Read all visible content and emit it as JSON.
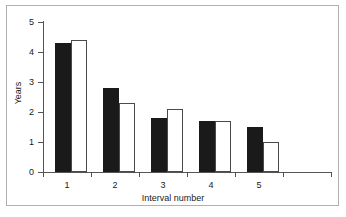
{
  "chart_data": {
    "type": "bar",
    "title": "",
    "subtitle": "",
    "xlabel": "Interval number",
    "ylabel": "Years",
    "categories": [
      "1",
      "2",
      "3",
      "4",
      "5"
    ],
    "series": [
      {
        "name": "series-dark",
        "color": "#1a1a1a",
        "values": [
          4.3,
          2.8,
          1.8,
          1.7,
          1.5
        ]
      },
      {
        "name": "series-light",
        "color": "#ffffff",
        "values": [
          4.4,
          2.3,
          2.1,
          1.7,
          1.0
        ]
      }
    ],
    "ylim": [
      0,
      5
    ],
    "yticks": [
      0,
      1,
      2,
      3,
      4,
      5
    ],
    "ytick_labels": [
      "0",
      "1",
      "2",
      "3",
      "4",
      "5"
    ],
    "grid": false,
    "legend": "none"
  },
  "axes": {
    "y_labels": [
      "5",
      "4",
      "3",
      "2",
      "1",
      "0"
    ],
    "x_labels": [
      "1",
      "2",
      "3",
      "4",
      "5"
    ],
    "y_title": "Years",
    "x_title": "Interval number"
  },
  "colors": {
    "dark_bar": "#1a1a1a",
    "light_bar": "#ffffff",
    "bar_outline": "#4a4a4a",
    "axis": "#555555",
    "frame": "#b0b0b0",
    "text": "#1a1a1a",
    "background": "#ffffff"
  }
}
